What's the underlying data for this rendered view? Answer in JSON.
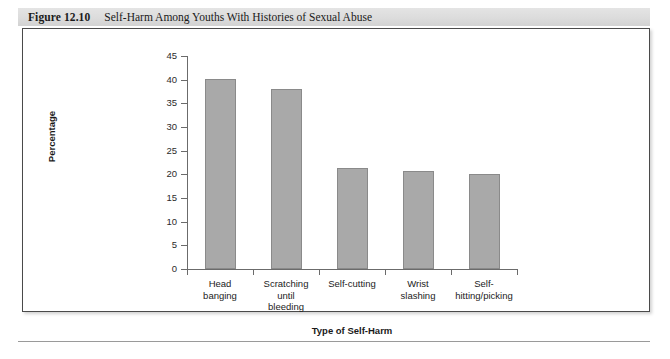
{
  "figure": {
    "number": "Figure 12.10",
    "title": "Self-Harm Among Youths With Histories of Sexual Abuse"
  },
  "chart_data": {
    "type": "bar",
    "title": "Self-Harm Among Youths With Histories of Sexual Abuse",
    "categories": [
      "Head\nbanging",
      "Scratching\nuntil\nbleeding",
      "Self-cutting",
      "Wrist\nslashing",
      "Self-\nhitting/picking"
    ],
    "values": [
      40.2,
      38.0,
      21.3,
      20.6,
      20.0
    ],
    "xlabel": "Type of Self-Harm",
    "ylabel": "Percentage",
    "ylim": [
      0,
      45
    ],
    "yticks": [
      0,
      5,
      10,
      15,
      20,
      25,
      30,
      35,
      40,
      45
    ],
    "ytick_labels": [
      "0",
      "5",
      "10",
      "15",
      "20",
      "25",
      "30",
      "35",
      "40",
      "45"
    ],
    "grid": false,
    "legend": null,
    "bar_color": "#a9a9a9",
    "bar_edge_color": "#8a8a8a",
    "axis_color": "#6b6b6b"
  }
}
